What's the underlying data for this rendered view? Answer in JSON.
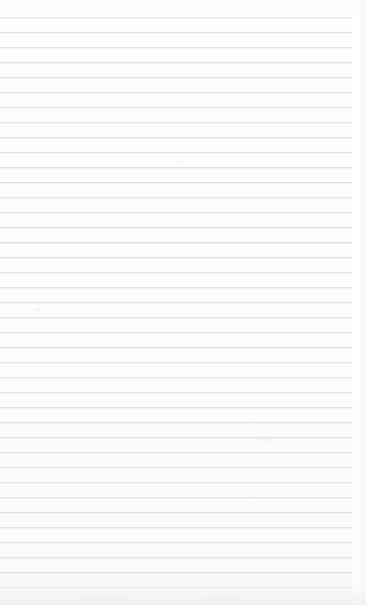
{
  "document": {
    "kind": "scanned-ruled-paper",
    "content_text": "",
    "page_width": 366,
    "page_height": 605,
    "background_color": "#fdfdfd"
  },
  "ruling": {
    "line_color": "#e0e0e0",
    "line_thickness": 1,
    "line_spacing": 15,
    "first_line_y": 17,
    "last_line_y": 587,
    "line_start_x": 0,
    "line_end_x": 352,
    "line_count": 39,
    "line_y_positions": [
      17,
      32,
      47,
      62,
      77,
      92,
      107,
      122,
      137,
      152,
      167,
      182,
      197,
      212,
      227,
      242,
      257,
      272,
      287,
      302,
      317,
      332,
      347,
      362,
      377,
      392,
      407,
      422,
      437,
      452,
      467,
      482,
      497,
      512,
      527,
      542,
      557,
      572,
      587
    ]
  },
  "margin": {
    "right_margin_width": 14,
    "right_margin_color": "#ffffff"
  },
  "artifacts": {
    "specks": [
      {
        "x": 36,
        "y": 308,
        "size": 3
      },
      {
        "x": 178,
        "y": 161,
        "size": 2
      },
      {
        "x": 224,
        "y": 185,
        "size": 2
      },
      {
        "x": 116,
        "y": 3,
        "size": 2
      },
      {
        "x": 300,
        "y": 520,
        "size": 2
      }
    ],
    "smudges": [
      {
        "x": 258,
        "y": 437,
        "width": 14,
        "height": 4
      },
      {
        "x": 84,
        "y": 596,
        "width": 40,
        "height": 5
      },
      {
        "x": 205,
        "y": 598,
        "width": 34,
        "height": 5
      }
    ]
  }
}
